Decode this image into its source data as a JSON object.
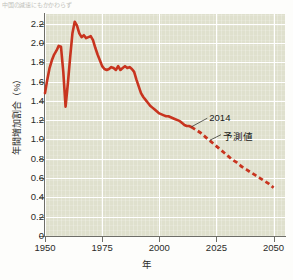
{
  "figure": {
    "top_caption": "中国の減速にもかかわらず"
  },
  "chart_data": {
    "type": "line",
    "title": "",
    "xlabel": "年",
    "ylabel": "年間増加割合（%）",
    "xlim": [
      1950,
      2055
    ],
    "ylim": [
      0,
      2.3
    ],
    "grid": true,
    "legend": false,
    "xticks": [
      1950,
      1975,
      2000,
      2025,
      2050
    ],
    "xticklabels": [
      "1950",
      "1975",
      "2000",
      "2025",
      "2050"
    ],
    "yticks": [
      0,
      0.2,
      0.4,
      0.6,
      0.8,
      1.0,
      1.2,
      1.4,
      1.6,
      1.8,
      2.0,
      2.2
    ],
    "yticklabels": [
      "0",
      "0.2",
      "0.4",
      "0.6",
      "0.8",
      "1.0",
      "1.2",
      "1.4",
      "1.6",
      "1.8",
      "2.0",
      "2.2"
    ],
    "line_color": "#c8341f",
    "annotations": [
      {
        "name": "2014",
        "text": "2014",
        "x": 2021,
        "y": 1.22
      },
      {
        "name": "forecast",
        "text": "予測値",
        "x": 2027,
        "y": 1.05
      }
    ],
    "series": [
      {
        "name": "observed",
        "style": "solid",
        "x": [
          1950,
          1951,
          1952,
          1953,
          1954,
          1955,
          1956,
          1957,
          1958,
          1959,
          1960,
          1961,
          1962,
          1963,
          1964,
          1965,
          1966,
          1967,
          1968,
          1969,
          1970,
          1971,
          1972,
          1973,
          1974,
          1975,
          1976,
          1977,
          1978,
          1979,
          1980,
          1981,
          1982,
          1983,
          1984,
          1985,
          1986,
          1987,
          1988,
          1989,
          1990,
          1991,
          1992,
          1993,
          1994,
          1995,
          1996,
          1997,
          1998,
          1999,
          2000,
          2001,
          2002,
          2003,
          2004,
          2005,
          2006,
          2007,
          2008,
          2009,
          2010,
          2011,
          2012,
          2013,
          2014
        ],
        "y": [
          1.48,
          1.62,
          1.74,
          1.82,
          1.88,
          1.92,
          1.97,
          1.96,
          1.7,
          1.34,
          1.58,
          1.85,
          2.1,
          2.22,
          2.18,
          2.1,
          2.06,
          2.08,
          2.05,
          2.06,
          2.07,
          2.03,
          1.95,
          1.88,
          1.82,
          1.76,
          1.73,
          1.72,
          1.73,
          1.75,
          1.74,
          1.72,
          1.76,
          1.72,
          1.74,
          1.76,
          1.74,
          1.75,
          1.73,
          1.7,
          1.62,
          1.55,
          1.48,
          1.44,
          1.41,
          1.38,
          1.35,
          1.33,
          1.31,
          1.29,
          1.27,
          1.26,
          1.25,
          1.24,
          1.24,
          1.23,
          1.22,
          1.21,
          1.2,
          1.19,
          1.17,
          1.15,
          1.14,
          1.14,
          1.13
        ]
      },
      {
        "name": "projected",
        "style": "dashed",
        "x": [
          2014,
          2016,
          2018,
          2020,
          2022,
          2024,
          2026,
          2028,
          2030,
          2032,
          2034,
          2036,
          2038,
          2040,
          2042,
          2044,
          2046,
          2048,
          2050
        ],
        "y": [
          1.13,
          1.1,
          1.07,
          1.03,
          0.99,
          0.95,
          0.91,
          0.87,
          0.83,
          0.79,
          0.76,
          0.72,
          0.69,
          0.66,
          0.63,
          0.6,
          0.57,
          0.54,
          0.5
        ]
      }
    ]
  }
}
